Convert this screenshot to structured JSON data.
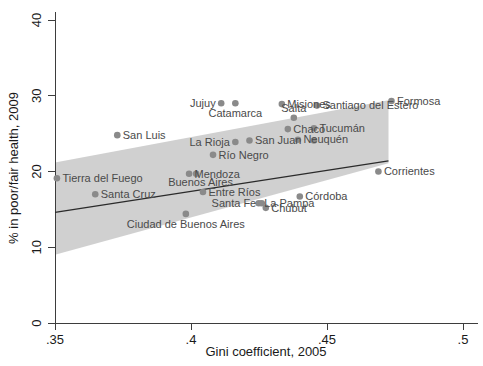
{
  "chart_data": {
    "type": "scatter",
    "title": "",
    "xlabel": "Gini coefficient, 2005",
    "ylabel": "% in poor/fair health, 2009",
    "xlim": [
      0.34,
      0.505
    ],
    "ylim": [
      0,
      42
    ],
    "xticks": [
      0.35,
      0.4,
      0.45,
      0.5
    ],
    "xtick_labels": [
      ".35",
      ".4",
      ".45",
      ".5"
    ],
    "yticks": [
      0,
      10,
      20,
      30,
      40
    ],
    "ytick_labels": [
      "0",
      "10",
      "20",
      "30",
      "40"
    ],
    "grid": false,
    "legend": null,
    "marker_color": "#8a8a8a",
    "fit_line_color": "#2b2b2b",
    "ci_band_color": "#c8c8c8",
    "points": [
      {
        "label": "Tierra del Fuego",
        "x": 0.3507,
        "y": 19.1,
        "label_pos": "right"
      },
      {
        "label": "Santa Cruz",
        "x": 0.3648,
        "y": 17.0,
        "label_pos": "right"
      },
      {
        "label": "San Luis",
        "x": 0.3729,
        "y": 24.8,
        "label_pos": "right"
      },
      {
        "label": "Ciudad de Buenos Aires",
        "x": 0.3981,
        "y": 14.4,
        "label_pos": "below"
      },
      {
        "label": "Mendoza",
        "x": 0.3993,
        "y": 19.7,
        "label_pos": "right"
      },
      {
        "label": "Buenos Aires",
        "x": 0.4019,
        "y": 19.7,
        "label_pos": "below-left"
      },
      {
        "label": "Entre Ríos",
        "x": 0.4044,
        "y": 17.3,
        "label_pos": "right"
      },
      {
        "label": "Río Negro",
        "x": 0.4081,
        "y": 22.2,
        "label_pos": "right"
      },
      {
        "label": "Jujuy",
        "x": 0.4111,
        "y": 29.0,
        "label_pos": "left"
      },
      {
        "label": "La Rioja",
        "x": 0.4163,
        "y": 23.9,
        "label_pos": "left"
      },
      {
        "label": "Catamarca",
        "x": 0.4163,
        "y": 29.0,
        "label_pos": "below"
      },
      {
        "label": "San Juan",
        "x": 0.4215,
        "y": 24.1,
        "label_pos": "right"
      },
      {
        "label": "La Pampa",
        "x": 0.4249,
        "y": 15.8,
        "label_pos": "right"
      },
      {
        "label": "Santa Fe",
        "x": 0.426,
        "y": 15.8,
        "label_pos": "left"
      },
      {
        "label": "Chubut",
        "x": 0.4275,
        "y": 15.2,
        "label_pos": "right"
      },
      {
        "label": "Misiones",
        "x": 0.4334,
        "y": 28.9,
        "label_pos": "right"
      },
      {
        "label": "Chaco",
        "x": 0.4356,
        "y": 25.6,
        "label_pos": "right"
      },
      {
        "label": "Salta",
        "x": 0.4378,
        "y": 27.1,
        "label_pos": "above"
      },
      {
        "label": "Neuquén",
        "x": 0.4393,
        "y": 24.2,
        "label_pos": "right"
      },
      {
        "label": "Tucumán",
        "x": 0.4452,
        "y": 25.7,
        "label_pos": "right"
      },
      {
        "label": "Santa Fe 2",
        "x": 0.4452,
        "y": 24.1,
        "label_pos": "none"
      },
      {
        "label": "Santiago del Estero",
        "x": 0.4463,
        "y": 28.7,
        "label_pos": "right"
      },
      {
        "label": "Córdoba",
        "x": 0.44,
        "y": 16.7,
        "label_pos": "right"
      },
      {
        "label": "Corrientes",
        "x": 0.4689,
        "y": 20.0,
        "label_pos": "right"
      },
      {
        "label": "Formosa",
        "x": 0.4737,
        "y": 29.3,
        "label_pos": "right"
      }
    ],
    "fit_line": {
      "x1": 0.35,
      "y1": 14.6,
      "x2": 0.4726,
      "y2": 21.4
    },
    "ci_band": {
      "x_left": 0.35,
      "x_right": 0.4726,
      "upper_left": 21.2,
      "lower_left": 9.0,
      "upper_right": 29.4,
      "lower_right": 21.1
    }
  },
  "axes": {
    "x_title": "Gini coefficient, 2005",
    "y_title": "% in poor/fair health, 2009"
  },
  "labels": {
    "tierra_del_fuego": "Tierra del Fuego",
    "santa_cruz": "Santa Cruz",
    "san_luis": "San Luis",
    "ciudad_de_buenos_aires": "Ciudad de Buenos Aires",
    "mendoza": "Mendoza",
    "buenos_aires": "Buenos Aires",
    "entre_rios": "Entre Ríos",
    "rio_negro": "Río Negro",
    "jujuy": "Jujuy",
    "la_rioja": "La Rioja",
    "catamarca": "Catamarca",
    "san_juan": "San Juan",
    "la_pampa": "La Pampa",
    "santa_fe": "Santa Fe",
    "chubut": "Chubut",
    "misiones": "Misiones",
    "chaco": "Chaco",
    "salta": "Salta",
    "neuquen": "Neuquén",
    "tucuman": "Tucumán",
    "santiago_del_estero": "Santiago del Estero",
    "cordoba": "Córdoba",
    "corrientes": "Corrientes",
    "formosa": "Formosa"
  }
}
